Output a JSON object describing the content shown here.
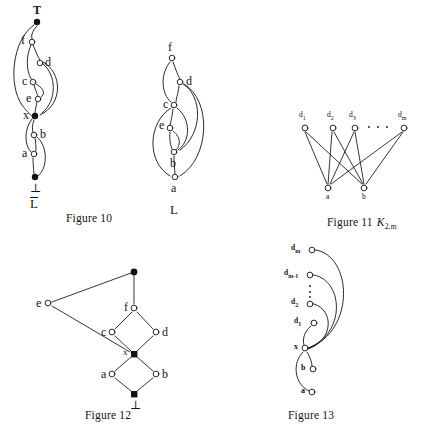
{
  "page": {
    "width": 423,
    "height": 436,
    "background": "#ffffff",
    "ink": "#131313"
  },
  "figures": [
    {
      "id": "figure-10",
      "caption": "Figure 10",
      "diagram_label": "L",
      "diagram_label_overlined": true,
      "nodes": [
        {
          "name": "T",
          "label": "T",
          "filled": true,
          "x": 37,
          "y": 22,
          "label_pos": "above"
        },
        {
          "name": "f",
          "label": "f",
          "filled": false,
          "x": 32,
          "y": 42,
          "label_pos": "left"
        },
        {
          "name": "d",
          "label": "d",
          "filled": false,
          "x": 40,
          "y": 63,
          "label_pos": "right"
        },
        {
          "name": "c",
          "label": "c",
          "filled": false,
          "x": 33,
          "y": 82,
          "label_pos": "left"
        },
        {
          "name": "e",
          "label": "e",
          "filled": false,
          "x": 38,
          "y": 99,
          "label_pos": "left"
        },
        {
          "name": "x",
          "label": "x",
          "filled": true,
          "x": 35,
          "y": 116,
          "label_pos": "left"
        },
        {
          "name": "b",
          "label": "b",
          "filled": false,
          "x": 34,
          "y": 135,
          "label_pos": "right"
        },
        {
          "name": "a",
          "label": "a",
          "filled": false,
          "x": 34,
          "y": 154,
          "label_pos": "left"
        },
        {
          "name": "bot",
          "label": "⊥",
          "filled": true,
          "x": 35,
          "y": 177,
          "label_pos": "below"
        }
      ]
    },
    {
      "id": "figure-l",
      "caption": "",
      "diagram_label": "L",
      "diagram_label_overlined": false,
      "nodes": [
        {
          "name": "f",
          "label": "f",
          "filled": false,
          "x": 172,
          "y": 58,
          "label_pos": "above"
        },
        {
          "name": "d",
          "label": "d",
          "filled": false,
          "x": 180,
          "y": 82,
          "label_pos": "right"
        },
        {
          "name": "c",
          "label": "c",
          "filled": false,
          "x": 174,
          "y": 105,
          "label_pos": "left"
        },
        {
          "name": "e",
          "label": "e",
          "filled": false,
          "x": 170,
          "y": 128,
          "label_pos": "left"
        },
        {
          "name": "b",
          "label": "b",
          "filled": false,
          "x": 174,
          "y": 152,
          "label_pos": "below"
        },
        {
          "name": "a",
          "label": "a",
          "filled": false,
          "x": 175,
          "y": 177,
          "label_pos": "below"
        }
      ]
    },
    {
      "id": "figure-11",
      "caption": "Figure 11",
      "caption_math": "K",
      "caption_sub": "2,m",
      "ellipsis": "· · ·",
      "top_nodes": [
        {
          "name": "d1",
          "label": "d",
          "sub": "1",
          "x": 305,
          "y": 128
        },
        {
          "name": "d2",
          "label": "d",
          "sub": "2",
          "x": 333,
          "y": 128
        },
        {
          "name": "d3",
          "label": "d",
          "sub": "3",
          "x": 355,
          "y": 128
        },
        {
          "name": "dm",
          "label": "d",
          "sub": "m",
          "x": 404,
          "y": 128
        }
      ],
      "bottom_nodes": [
        {
          "name": "a",
          "label": "a",
          "x": 328,
          "y": 188
        },
        {
          "name": "b",
          "label": "b",
          "x": 364,
          "y": 188
        }
      ]
    },
    {
      "id": "figure-12",
      "caption": "Figure 12",
      "nodes": [
        {
          "name": "T",
          "label": "",
          "filled": true,
          "x": 134,
          "y": 272,
          "label_pos": "none"
        },
        {
          "name": "e",
          "label": "e",
          "filled": false,
          "x": 48,
          "y": 303,
          "label_pos": "left"
        },
        {
          "name": "f",
          "label": "f",
          "filled": false,
          "x": 134,
          "y": 308,
          "label_pos": "left"
        },
        {
          "name": "c",
          "label": "c",
          "filled": false,
          "x": 112,
          "y": 332,
          "label_pos": "left"
        },
        {
          "name": "d",
          "label": "d",
          "filled": false,
          "x": 156,
          "y": 332,
          "label_pos": "right"
        },
        {
          "name": "x",
          "label": "x",
          "filled": true,
          "x": 134,
          "y": 354,
          "label_pos": "left"
        },
        {
          "name": "a",
          "label": "a",
          "filled": false,
          "x": 112,
          "y": 374,
          "label_pos": "left"
        },
        {
          "name": "b",
          "label": "b",
          "filled": false,
          "x": 156,
          "y": 374,
          "label_pos": "right"
        },
        {
          "name": "bot",
          "label": "⊥",
          "filled": true,
          "x": 134,
          "y": 394,
          "label_pos": "below"
        }
      ]
    },
    {
      "id": "figure-13",
      "caption": "Figure 13",
      "ellipsis_vertical": true,
      "nodes": [
        {
          "name": "dm",
          "label": "d",
          "sub": "m",
          "filled": false,
          "x": 312,
          "y": 250
        },
        {
          "name": "dm1",
          "label": "d",
          "sub": "m-1",
          "filled": false,
          "x": 310,
          "y": 275
        },
        {
          "name": "d2",
          "label": "d",
          "sub": "2",
          "filled": false,
          "x": 310,
          "y": 303
        },
        {
          "name": "d1",
          "label": "d",
          "sub": "1",
          "filled": false,
          "x": 314,
          "y": 323
        },
        {
          "name": "x",
          "label": "x",
          "sub": "",
          "filled": false,
          "x": 305,
          "y": 348
        },
        {
          "name": "b",
          "label": "b",
          "sub": "",
          "filled": false,
          "x": 313,
          "y": 369
        },
        {
          "name": "a",
          "label": "a",
          "sub": "",
          "filled": false,
          "x": 312,
          "y": 392
        }
      ]
    }
  ]
}
